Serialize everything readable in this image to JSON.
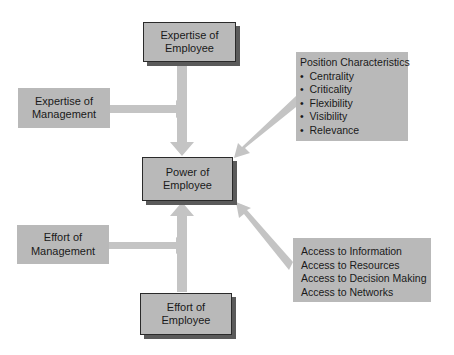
{
  "diagram": {
    "center": {
      "line1": "Power of",
      "line2": "Employee"
    },
    "top": {
      "line1": "Expertise of",
      "line2": "Employee"
    },
    "bottom": {
      "line1": "Effort of",
      "line2": "Employee"
    },
    "left_top": {
      "line1": "Expertise of",
      "line2": "Management"
    },
    "left_bottom": {
      "line1": "Effort of",
      "line2": "Management"
    },
    "position": {
      "title": "Position Characteristics",
      "items": [
        "Centrality",
        "Criticality",
        "Flexibility",
        "Visibility",
        "Relevance"
      ],
      "bullet": "•"
    },
    "access": {
      "items": [
        "Access to Information",
        "Access to Resources",
        "Access to Decision Making",
        "Access to Networks"
      ]
    },
    "colors": {
      "box_fill": "#b9b9b9",
      "arrow": "#c4c4c4",
      "shadow": "#5a5a5a",
      "border": "#2a2a2a"
    }
  }
}
